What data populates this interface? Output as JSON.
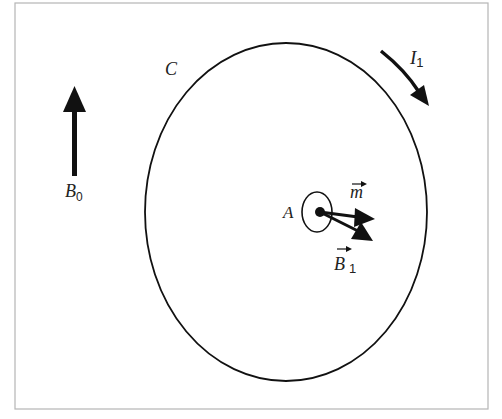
{
  "figure": {
    "labels": {
      "loop": "C",
      "current": "I",
      "current_sub": "1",
      "external_field": "B",
      "external_field_sub": "0",
      "point": "A",
      "moment": "m",
      "induced_field": "B",
      "induced_field_sub": "1"
    },
    "elements": {
      "loop_description": "large circular current loop C",
      "small_loop_description": "small loop with magnetic moment m at point A",
      "external_field_direction": "up",
      "current_direction": "clockwise"
    },
    "colors": {
      "stroke": "#111111",
      "frame": "#b5b5b5",
      "background": "#ffffff"
    }
  }
}
